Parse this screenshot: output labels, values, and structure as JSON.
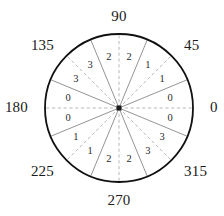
{
  "figure": {
    "type": "polar-sector-diagram",
    "center": {
      "x": 119,
      "y": 108
    },
    "radius": 74,
    "outline_color": "#111111",
    "solid_spoke_color": "#888888",
    "dashed_spoke_color": "#b0b0b0",
    "center_marker_color": "#1a1a1a",
    "background_color": "#ffffff",
    "sector_count": 16,
    "sector_span_degrees": 22.5
  },
  "axis_labels": [
    {
      "name": "axis-label-0",
      "text": "0",
      "angle": 0,
      "x": 210,
      "y": 108,
      "align": "left"
    },
    {
      "name": "axis-label-45",
      "text": "45",
      "angle": 45,
      "x": 184,
      "y": 46,
      "align": "left"
    },
    {
      "name": "axis-label-90",
      "text": "90",
      "angle": 90,
      "x": 119,
      "y": 17,
      "align": "center"
    },
    {
      "name": "axis-label-135",
      "text": "135",
      "angle": 135,
      "x": 54,
      "y": 46,
      "align": "right"
    },
    {
      "name": "axis-label-180",
      "text": "180",
      "angle": 180,
      "x": 28,
      "y": 108,
      "align": "right"
    },
    {
      "name": "axis-label-225",
      "text": "225",
      "angle": 225,
      "x": 54,
      "y": 172,
      "align": "right"
    },
    {
      "name": "axis-label-270",
      "text": "270",
      "angle": 270,
      "x": 119,
      "y": 201,
      "align": "center"
    },
    {
      "name": "axis-label-315",
      "text": "315",
      "angle": 315,
      "x": 184,
      "y": 172,
      "align": "left"
    }
  ],
  "sectors": [
    {
      "index": 0,
      "value": "0",
      "start_angle": 0,
      "end_angle": 22.5,
      "mid_angle": 11.25,
      "label_radius": 52
    },
    {
      "index": 1,
      "value": "1",
      "start_angle": 22.5,
      "end_angle": 45,
      "mid_angle": 33.75,
      "label_radius": 52
    },
    {
      "index": 2,
      "value": "1",
      "start_angle": 45,
      "end_angle": 67.5,
      "mid_angle": 56.25,
      "label_radius": 52
    },
    {
      "index": 3,
      "value": "2",
      "start_angle": 67.5,
      "end_angle": 90,
      "mid_angle": 78.75,
      "label_radius": 52
    },
    {
      "index": 4,
      "value": "2",
      "start_angle": 90,
      "end_angle": 112.5,
      "mid_angle": 101.25,
      "label_radius": 52
    },
    {
      "index": 5,
      "value": "3",
      "start_angle": 112.5,
      "end_angle": 135,
      "mid_angle": 123.75,
      "label_radius": 52
    },
    {
      "index": 6,
      "value": "3",
      "start_angle": 135,
      "end_angle": 157.5,
      "mid_angle": 146.25,
      "label_radius": 52
    },
    {
      "index": 7,
      "value": "0",
      "start_angle": 157.5,
      "end_angle": 180,
      "mid_angle": 168.75,
      "label_radius": 52
    },
    {
      "index": 8,
      "value": "0",
      "start_angle": 180,
      "end_angle": 202.5,
      "mid_angle": 191.25,
      "label_radius": 52
    },
    {
      "index": 9,
      "value": "1",
      "start_angle": 202.5,
      "end_angle": 225,
      "mid_angle": 213.75,
      "label_radius": 52
    },
    {
      "index": 10,
      "value": "1",
      "start_angle": 225,
      "end_angle": 247.5,
      "mid_angle": 236.25,
      "label_radius": 52
    },
    {
      "index": 11,
      "value": "2",
      "start_angle": 247.5,
      "end_angle": 270,
      "mid_angle": 258.75,
      "label_radius": 52
    },
    {
      "index": 12,
      "value": "2",
      "start_angle": 270,
      "end_angle": 292.5,
      "mid_angle": 281.25,
      "label_radius": 52
    },
    {
      "index": 13,
      "value": "3",
      "start_angle": 292.5,
      "end_angle": 315,
      "mid_angle": 303.75,
      "label_radius": 52
    },
    {
      "index": 14,
      "value": "3",
      "start_angle": 315,
      "end_angle": 337.5,
      "mid_angle": 326.25,
      "label_radius": 52
    },
    {
      "index": 15,
      "value": "0",
      "start_angle": 337.5,
      "end_angle": 360,
      "mid_angle": 348.75,
      "label_radius": 52
    }
  ],
  "spokes": [
    {
      "angle": 0,
      "style": "dashed"
    },
    {
      "angle": 22.5,
      "style": "solid"
    },
    {
      "angle": 45,
      "style": "dashed"
    },
    {
      "angle": 67.5,
      "style": "solid"
    },
    {
      "angle": 90,
      "style": "dashed"
    },
    {
      "angle": 112.5,
      "style": "solid"
    },
    {
      "angle": 135,
      "style": "dashed"
    },
    {
      "angle": 157.5,
      "style": "solid"
    },
    {
      "angle": 180,
      "style": "dashed"
    },
    {
      "angle": 202.5,
      "style": "solid"
    },
    {
      "angle": 225,
      "style": "dashed"
    },
    {
      "angle": 247.5,
      "style": "solid"
    },
    {
      "angle": 270,
      "style": "dashed"
    },
    {
      "angle": 292.5,
      "style": "solid"
    },
    {
      "angle": 315,
      "style": "dashed"
    },
    {
      "angle": 337.5,
      "style": "solid"
    }
  ],
  "chart_data": {
    "type": "pie",
    "title": "",
    "xlabel": "",
    "ylabel": "",
    "categories": [
      "0-22.5",
      "22.5-45",
      "45-67.5",
      "67.5-90",
      "90-112.5",
      "112.5-135",
      "135-157.5",
      "157.5-180",
      "180-202.5",
      "202.5-225",
      "225-247.5",
      "247.5-270",
      "270-292.5",
      "292.5-315",
      "315-337.5",
      "337.5-360"
    ],
    "values": [
      0,
      1,
      1,
      2,
      2,
      3,
      3,
      0,
      0,
      1,
      1,
      2,
      2,
      3,
      3,
      0
    ],
    "tick_labels": [
      "0",
      "45",
      "90",
      "135",
      "180",
      "225",
      "270",
      "315"
    ],
    "tick_angles": [
      0,
      45,
      90,
      135,
      180,
      225,
      270,
      315
    ],
    "grid": true,
    "legend": "none",
    "angular_range": [
      0,
      360
    ]
  }
}
